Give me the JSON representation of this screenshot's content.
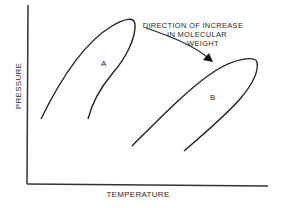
{
  "diagram": {
    "x_axis_label": "TEMPERATURE",
    "y_axis_label": "PRESSURE",
    "annotation": {
      "line1": "DIRECTION OF INCREASE",
      "line2": "IN MOLECULAR",
      "line3": "WEIGHT"
    },
    "curves": [
      {
        "label": "A"
      },
      {
        "label": "B"
      }
    ],
    "line_color": "#222222"
  }
}
